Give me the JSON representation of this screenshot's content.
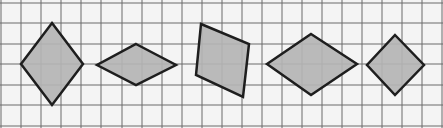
{
  "diagram": {
    "background": "#f4f4f4",
    "grid": {
      "color": "#6b6b6b",
      "x_lines": [
        1,
        21,
        41,
        61,
        81,
        101,
        122,
        142,
        162,
        182,
        202,
        222,
        242,
        262,
        282,
        302,
        322,
        342,
        362,
        382,
        402,
        422,
        442
      ],
      "y_lines": [
        3,
        23,
        44,
        64,
        85,
        105,
        126
      ]
    },
    "shape_style": {
      "fill": "#b4b4b4",
      "stroke": "#1e1e1e",
      "stroke_width": 2.5
    },
    "shapes": [
      {
        "name": "rhombus-1",
        "points": [
          [
            52,
            23
          ],
          [
            83,
            64
          ],
          [
            52,
            105
          ],
          [
            21,
            64
          ]
        ]
      },
      {
        "name": "rhombus-2",
        "points": [
          [
            136,
            44
          ],
          [
            176,
            65
          ],
          [
            136,
            85
          ],
          [
            97,
            65
          ]
        ]
      },
      {
        "name": "quadrilateral-3",
        "points": [
          [
            201,
            24
          ],
          [
            249,
            44
          ],
          [
            243,
            97
          ],
          [
            196,
            75
          ]
        ]
      },
      {
        "name": "rhombus-4",
        "points": [
          [
            311,
            34
          ],
          [
            357,
            64
          ],
          [
            311,
            95
          ],
          [
            267,
            64
          ]
        ]
      },
      {
        "name": "square-5",
        "points": [
          [
            395,
            35
          ],
          [
            424,
            65
          ],
          [
            395,
            95
          ],
          [
            367,
            65
          ]
        ]
      }
    ]
  }
}
